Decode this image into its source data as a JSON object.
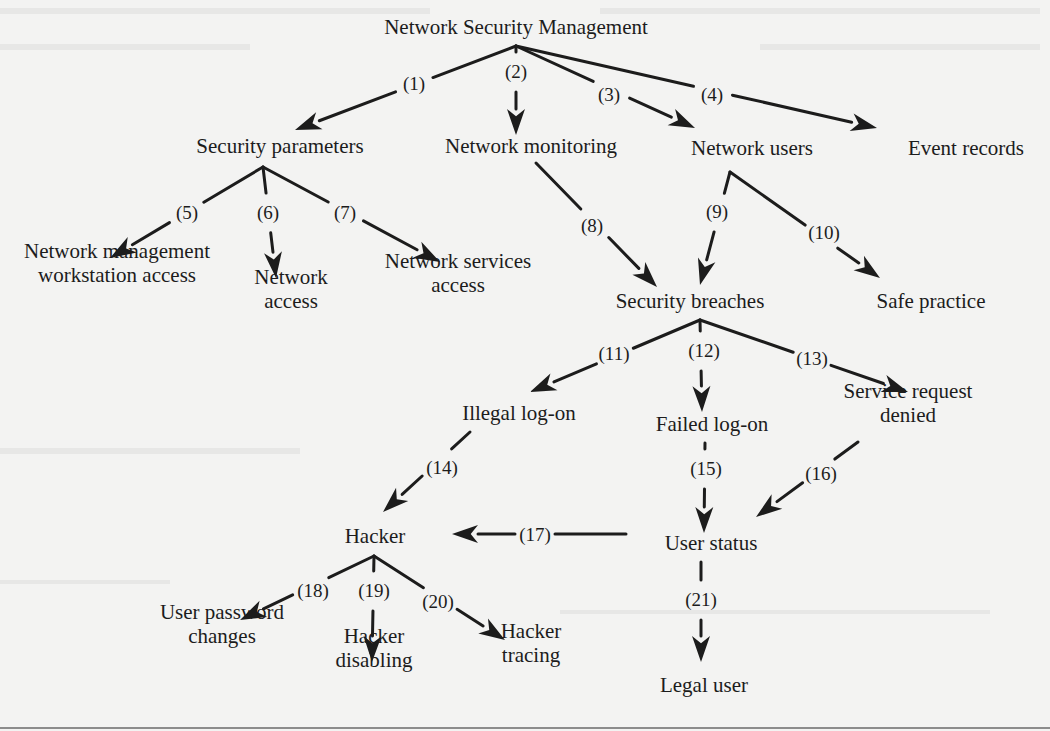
{
  "diagram": {
    "title": "Network Security Management",
    "colors": {
      "ink": "#1c1c1c",
      "paper": "#f3f3f2",
      "rule": "#6a6a6a"
    },
    "nodes": [
      {
        "id": "root",
        "lines": [
          "Network Security Management"
        ],
        "x": 516,
        "y": 34
      },
      {
        "id": "security-parameters",
        "lines": [
          "Security parameters"
        ],
        "x": 280,
        "y": 153
      },
      {
        "id": "network-monitoring",
        "lines": [
          "Network monitoring"
        ],
        "x": 531,
        "y": 153
      },
      {
        "id": "network-users",
        "lines": [
          "Network users"
        ],
        "x": 752,
        "y": 155
      },
      {
        "id": "event-records",
        "lines": [
          "Event records"
        ],
        "x": 966,
        "y": 155
      },
      {
        "id": "nm-workstation-access",
        "lines": [
          "Network management",
          "workstation access"
        ],
        "x": 117,
        "y": 282
      },
      {
        "id": "network-access",
        "lines": [
          "Network",
          "access"
        ],
        "x": 291,
        "y": 308
      },
      {
        "id": "network-services-access",
        "lines": [
          "Network services",
          "access"
        ],
        "x": 458,
        "y": 292
      },
      {
        "id": "security-breaches",
        "lines": [
          "Security breaches"
        ],
        "x": 690,
        "y": 308
      },
      {
        "id": "safe-practice",
        "lines": [
          "Safe practice"
        ],
        "x": 931,
        "y": 308
      },
      {
        "id": "illegal-log-on",
        "lines": [
          "Illegal log-on"
        ],
        "x": 519,
        "y": 420
      },
      {
        "id": "failed-log-on",
        "lines": [
          "Failed log-on"
        ],
        "x": 712,
        "y": 431
      },
      {
        "id": "service-request-denied",
        "lines": [
          "Service request",
          "denied"
        ],
        "x": 908,
        "y": 422
      },
      {
        "id": "hacker",
        "lines": [
          "Hacker"
        ],
        "x": 375,
        "y": 543
      },
      {
        "id": "user-status",
        "lines": [
          "User status"
        ],
        "x": 711,
        "y": 550
      },
      {
        "id": "user-password-changes",
        "lines": [
          "User password",
          "changes"
        ],
        "x": 222,
        "y": 643
      },
      {
        "id": "hacker-disabling",
        "lines": [
          "Hacker",
          "disabling"
        ],
        "x": 374,
        "y": 667
      },
      {
        "id": "hacker-tracing",
        "lines": [
          "Hacker",
          "tracing"
        ],
        "x": 531,
        "y": 662
      },
      {
        "id": "legal-user",
        "lines": [
          "Legal user"
        ],
        "x": 704,
        "y": 692
      }
    ],
    "edges": [
      {
        "num": "(1)",
        "from": [
          516,
          46
        ],
        "to": [
          295,
          130
        ],
        "lx": 414,
        "ly": 90
      },
      {
        "num": "(2)",
        "from": [
          516,
          46
        ],
        "to": [
          516,
          135
        ],
        "lx": 516,
        "ly": 78
      },
      {
        "num": "(3)",
        "from": [
          516,
          46
        ],
        "to": [
          695,
          128
        ],
        "lx": 609,
        "ly": 101
      },
      {
        "num": "(4)",
        "from": [
          516,
          46
        ],
        "to": [
          877,
          128
        ],
        "lx": 712,
        "ly": 101
      },
      {
        "num": "(5)",
        "from": [
          263,
          167
        ],
        "to": [
          110,
          258
        ],
        "lx": 187,
        "ly": 219
      },
      {
        "num": "(6)",
        "from": [
          263,
          167
        ],
        "to": [
          276,
          278
        ],
        "lx": 268,
        "ly": 219
      },
      {
        "num": "(7)",
        "from": [
          263,
          167
        ],
        "to": [
          440,
          262
        ],
        "lx": 345,
        "ly": 219
      },
      {
        "num": "(8)",
        "from": [
          536,
          163
        ],
        "to": [
          657,
          287
        ],
        "lx": 592,
        "ly": 232
      },
      {
        "num": "(9)",
        "from": [
          730,
          172
        ],
        "to": [
          700,
          285
        ],
        "lx": 717,
        "ly": 218
      },
      {
        "num": "(10)",
        "from": [
          730,
          172
        ],
        "to": [
          880,
          278
        ],
        "lx": 824,
        "ly": 239
      },
      {
        "num": "(11)",
        "from": [
          700,
          320
        ],
        "to": [
          530,
          392
        ],
        "lx": 614,
        "ly": 360
      },
      {
        "num": "(12)",
        "from": [
          700,
          320
        ],
        "to": [
          702,
          412
        ],
        "lx": 704,
        "ly": 357
      },
      {
        "num": "(13)",
        "from": [
          700,
          320
        ],
        "to": [
          908,
          392
        ],
        "lx": 812,
        "ly": 365
      },
      {
        "num": "(14)",
        "from": [
          470,
          432
        ],
        "to": [
          383,
          512
        ],
        "lx": 442,
        "ly": 474
      },
      {
        "num": "(15)",
        "from": [
          705,
          443
        ],
        "to": [
          704,
          533
        ],
        "lx": 706,
        "ly": 475
      },
      {
        "num": "(16)",
        "from": [
          858,
          442
        ],
        "to": [
          756,
          517
        ],
        "lx": 821,
        "ly": 480
      },
      {
        "num": "(17)",
        "from": [
          626,
          534
        ],
        "to": [
          452,
          534
        ],
        "lx": 535,
        "ly": 541
      },
      {
        "num": "(18)",
        "from": [
          374,
          556
        ],
        "to": [
          240,
          620
        ],
        "lx": 313,
        "ly": 597
      },
      {
        "num": "(19)",
        "from": [
          374,
          556
        ],
        "to": [
          372,
          662
        ],
        "lx": 374,
        "ly": 597
      },
      {
        "num": "(20)",
        "from": [
          374,
          556
        ],
        "to": [
          505,
          640
        ],
        "lx": 438,
        "ly": 608
      },
      {
        "num": "(21)",
        "from": [
          701,
          562
        ],
        "to": [
          701,
          662
        ],
        "lx": 701,
        "ly": 606
      }
    ]
  }
}
